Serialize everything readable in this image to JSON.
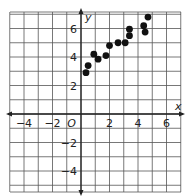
{
  "chart_data": {
    "type": "scatter",
    "title": "",
    "xlabel": "x",
    "ylabel": "y",
    "origin_label": "O",
    "xlim": [
      -5,
      7
    ],
    "ylim": [
      -5.5,
      7.2
    ],
    "grid": true,
    "grid_step": 1,
    "x_ticks": [
      -4,
      -2,
      2,
      4,
      6
    ],
    "y_ticks": [
      6,
      4,
      2,
      -2,
      -4
    ],
    "x_tick_labels": [
      "−4",
      "−2",
      "2",
      "4",
      "6"
    ],
    "y_tick_labels": [
      "6",
      "4",
      "2",
      "−2",
      "−4"
    ],
    "points": [
      {
        "x": 0.35,
        "y": 2.9
      },
      {
        "x": 0.5,
        "y": 3.4
      },
      {
        "x": 0.9,
        "y": 4.2
      },
      {
        "x": 1.2,
        "y": 3.85
      },
      {
        "x": 1.75,
        "y": 4.1
      },
      {
        "x": 2.0,
        "y": 4.8
      },
      {
        "x": 2.6,
        "y": 5.0
      },
      {
        "x": 3.1,
        "y": 5.0
      },
      {
        "x": 3.4,
        "y": 5.5
      },
      {
        "x": 3.4,
        "y": 5.95
      },
      {
        "x": 4.4,
        "y": 6.2
      },
      {
        "x": 4.5,
        "y": 5.75
      },
      {
        "x": 4.7,
        "y": 6.8
      }
    ],
    "colors": {
      "grid": "#555555",
      "axis": "#222222",
      "point": "#111111",
      "background": "#ffffff"
    }
  }
}
